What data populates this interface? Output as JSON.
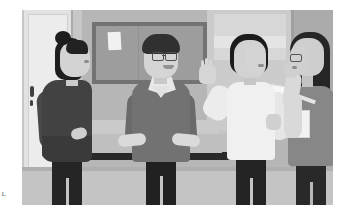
{
  "page": {
    "background_color": "#ffffff",
    "margin_number": "1."
  },
  "illustration": {
    "title": "Four colleagues talking in an office lounge",
    "style": "flat grayscale vector illustration",
    "palette": {
      "paper_white": "#ffffff",
      "wall_light": "#cacaca",
      "wall_mid": "#b4b4b4",
      "wall_dark": "#a9a9a9",
      "floor": "#c3c3c3",
      "skin": "#d2d2d2",
      "hair_black": "#171717",
      "garment_dark": "#3c3c3c",
      "garment_mid": "#6e6e6e",
      "garment_light": "#f0f0f0",
      "bench_base_black": "#232323"
    },
    "scene": {
      "setting": "office lounge / hallway",
      "background_objects": [
        {
          "name": "door",
          "position": "far left",
          "detail": "light panel door with dark handle"
        },
        {
          "name": "bulletin-board",
          "position": "upper center-left",
          "detail": "cork board in dark frame with two white papers pinned"
        },
        {
          "name": "wall-window-panel",
          "position": "upper right",
          "detail": "lighter recessed wall panel"
        },
        {
          "name": "bench",
          "position": "center",
          "detail": "low bench with cushions and black base"
        },
        {
          "name": "floor",
          "position": "bottom",
          "detail": "light gray floor"
        }
      ]
    },
    "figures": [
      {
        "id": "figure-1",
        "label": "Woman with hair bun",
        "position": "far left",
        "facing": "right, in profile",
        "hair": "black hair tied in a top bun",
        "clothing": "dark charcoal jacket, black trousers",
        "pose": "standing with right hand on hip, listening"
      },
      {
        "id": "figure-2",
        "label": "Man with glasses",
        "position": "center left",
        "facing": "forward / slightly right",
        "hair": "short dark hair",
        "clothing": "gray V-neck sweater over white collared shirt, black trousers",
        "pose": "standing, smiling, both hands resting forward on bench",
        "accessories": "eyeglasses"
      },
      {
        "id": "figure-3",
        "label": "Woman with bobbed hair",
        "position": "center right",
        "facing": "right",
        "hair": "black chin-length bob",
        "clothing": "white long-sleeve top, dark trousers",
        "pose": "left hand raised palm-out while speaking, holding papers in right hand",
        "accessories": "sheaf of white papers"
      },
      {
        "id": "figure-4",
        "label": "Woman with long hair",
        "position": "far right",
        "facing": "left, back three-quarter view",
        "hair": "long dark hair past the shoulders",
        "clothing": "gray top with light sleeves, dark trousers",
        "pose": "hand raised near face, listening",
        "accessories": "eyeglasses, light folder under arm"
      }
    ]
  }
}
